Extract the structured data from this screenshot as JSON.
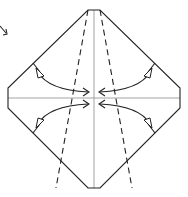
{
  "diagram": {
    "title": "",
    "type": "origami-fold-step",
    "colors": {
      "line": "#222222",
      "reference_line": "#999999",
      "background": "#ffffff"
    },
    "outline": {
      "shape": "octagon (square base with clipped corners)",
      "vertices": [
        [
          88,
          10
        ],
        [
          100,
          10
        ],
        [
          180,
          88
        ],
        [
          180,
          108
        ],
        [
          100,
          188
        ],
        [
          88,
          188
        ],
        [
          8,
          108
        ],
        [
          8,
          88
        ]
      ]
    },
    "crease_lines": [
      {
        "kind": "valley",
        "from": [
          88,
          10
        ],
        "to": [
          55,
          188
        ]
      },
      {
        "kind": "valley",
        "from": [
          100,
          10
        ],
        "to": [
          133,
          188
        ]
      },
      {
        "kind": "reference",
        "from": [
          94,
          10
        ],
        "to": [
          94,
          188
        ]
      },
      {
        "kind": "reference",
        "from": [
          8,
          98
        ],
        "to": [
          180,
          98
        ]
      }
    ],
    "arrows": [
      {
        "name": "fold-arrow-upper-left",
        "from": [
          36,
          70
        ],
        "to": [
          88,
          92
        ],
        "action": "valley fold"
      },
      {
        "name": "fold-arrow-upper-right",
        "from": [
          152,
          70
        ],
        "to": [
          100,
          92
        ],
        "action": "valley fold"
      },
      {
        "name": "fold-arrow-lower-left",
        "from": [
          36,
          126
        ],
        "to": [
          88,
          104
        ],
        "action": "valley fold"
      },
      {
        "name": "fold-arrow-lower-right",
        "from": [
          152,
          126
        ],
        "to": [
          100,
          104
        ],
        "action": "valley fold"
      }
    ],
    "corner_mark": {
      "name": "turn-over-arrow-corner",
      "position": [
        0,
        30
      ]
    }
  }
}
